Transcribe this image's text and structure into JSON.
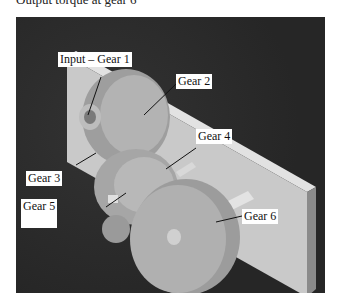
{
  "caption": "Output torque at gear 6",
  "figure": {
    "background_color": "#2a2a2a",
    "plate_color": "#c9c9c9",
    "gear_color": "#a8a8a8",
    "labels": [
      {
        "id": "gear1",
        "text": "Input – Gear 1"
      },
      {
        "id": "gear2",
        "text": "Gear 2"
      },
      {
        "id": "gear3",
        "text": "Gear 3"
      },
      {
        "id": "gear4",
        "text": "Gear 4"
      },
      {
        "id": "gear5",
        "text": "Gear 5"
      },
      {
        "id": "gear6",
        "text": "Gear 6"
      }
    ]
  }
}
